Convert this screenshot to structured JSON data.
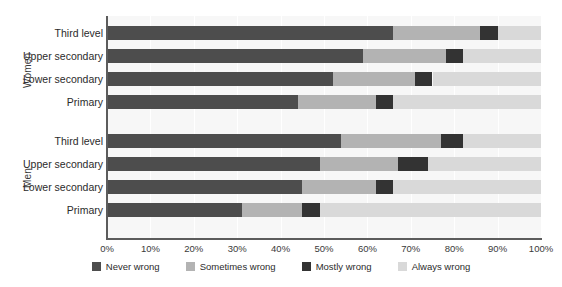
{
  "chart_data": {
    "type": "bar",
    "subtype": "stacked-horizontal-100pct",
    "title": "",
    "xlabel": "",
    "ylabel": "",
    "xlim": [
      0,
      100
    ],
    "grid": true,
    "legend_position": "bottom-center",
    "xtick_labels": [
      "0%",
      "10%",
      "20%",
      "30%",
      "40%",
      "50%",
      "60%",
      "70%",
      "80%",
      "90%",
      "100%"
    ],
    "xtick_values": [
      0,
      10,
      20,
      30,
      40,
      50,
      60,
      70,
      80,
      90,
      100
    ],
    "series": [
      {
        "name": "Never wrong",
        "color": "#4d4d4d"
      },
      {
        "name": "Sometimes wrong",
        "color": "#b3b3b3"
      },
      {
        "name": "Mostly wrong",
        "color": "#333333"
      },
      {
        "name": "Always wrong",
        "color": "#d9d9d9"
      }
    ],
    "groups": [
      {
        "label": "Women",
        "categories": [
          "Third level",
          "Upper secondary",
          "Lower secondary",
          "Primary"
        ],
        "rows": [
          {
            "category": "Third level",
            "values": [
              66,
              20,
              4,
              10
            ]
          },
          {
            "category": "Upper secondary",
            "values": [
              59,
              19,
              4,
              18
            ]
          },
          {
            "category": "Lower secondary",
            "values": [
              52,
              19,
              4,
              25
            ]
          },
          {
            "category": "Primary",
            "values": [
              44,
              18,
              4,
              34
            ]
          }
        ]
      },
      {
        "label": "Men",
        "categories": [
          "Third level",
          "Upper secondary",
          "Lower secondary",
          "Primary"
        ],
        "rows": [
          {
            "category": "Third level",
            "values": [
              54,
              23,
              5,
              18
            ]
          },
          {
            "category": "Upper secondary",
            "values": [
              49,
              18,
              7,
              26
            ]
          },
          {
            "category": "Lower secondary",
            "values": [
              45,
              17,
              4,
              34
            ]
          },
          {
            "category": "Primary",
            "values": [
              31,
              14,
              4,
              51
            ]
          }
        ]
      }
    ]
  },
  "colors": {
    "never_wrong": "#4d4d4d",
    "sometimes_wrong": "#b3b3b3",
    "mostly_wrong": "#333333",
    "always_wrong": "#d9d9d9",
    "plot_background": "#f7f7f7",
    "axis": "#5c5c5c",
    "page_background": "#ffffff"
  }
}
